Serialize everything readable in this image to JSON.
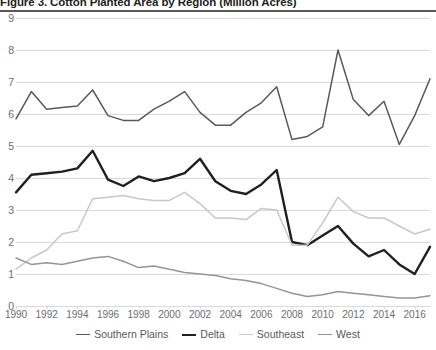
{
  "figure": {
    "title": "Figure 3. Cotton Planted Area by Region (Million Acres)"
  },
  "legend": {
    "position": "bottom-center",
    "items": [
      {
        "label": "Southern Plains",
        "color": "#58595b",
        "width": 1.6
      },
      {
        "label": "Delta",
        "color": "#231f20",
        "width": 2.6
      },
      {
        "label": "Southeast",
        "color": "#c7c8ca",
        "width": 1.6
      },
      {
        "label": "West",
        "color": "#939598",
        "width": 1.6
      }
    ]
  },
  "axis": {
    "y_ticks": [
      "0",
      "1",
      "2",
      "3",
      "4",
      "5",
      "6",
      "7",
      "8",
      "9"
    ],
    "x_ticks": [
      "1990",
      "1992",
      "1994",
      "1996",
      "1998",
      "2000",
      "2002",
      "2004",
      "2006",
      "2008",
      "2010",
      "2012",
      "2014",
      "2016"
    ]
  },
  "chart_data": {
    "type": "line",
    "title": "Figure 3. Cotton Planted Area by Region (Million Acres)",
    "xlabel": "",
    "ylabel": "Million Acres",
    "ylim": [
      0,
      9
    ],
    "xlim": [
      1990,
      2017
    ],
    "grid": true,
    "legend_position": "bottom-center",
    "x": [
      1990,
      1991,
      1992,
      1993,
      1994,
      1995,
      1996,
      1997,
      1998,
      1999,
      2000,
      2001,
      2002,
      2003,
      2004,
      2005,
      2006,
      2007,
      2008,
      2009,
      2010,
      2011,
      2012,
      2013,
      2014,
      2015,
      2016,
      2017
    ],
    "series": [
      {
        "name": "Southern Plains",
        "color": "#58595b",
        "values": [
          5.85,
          6.7,
          6.15,
          6.2,
          6.25,
          6.75,
          5.95,
          5.8,
          5.8,
          6.15,
          6.4,
          6.7,
          6.05,
          5.65,
          5.65,
          6.05,
          6.35,
          6.85,
          5.2,
          5.3,
          5.6,
          8.0,
          6.45,
          5.95,
          6.4,
          5.05,
          5.95,
          7.1
        ]
      },
      {
        "name": "Delta",
        "color": "#231f20",
        "values": [
          3.55,
          4.1,
          4.15,
          4.2,
          4.3,
          4.85,
          3.95,
          3.75,
          4.05,
          3.9,
          4.0,
          4.15,
          4.6,
          3.9,
          3.6,
          3.5,
          3.8,
          4.25,
          2.0,
          1.9,
          2.2,
          2.5,
          1.95,
          1.55,
          1.75,
          1.3,
          1.0,
          1.85
        ]
      },
      {
        "name": "Southeast",
        "color": "#c7c8ca",
        "values": [
          1.15,
          1.5,
          1.75,
          2.25,
          2.35,
          3.35,
          3.4,
          3.45,
          3.35,
          3.3,
          3.3,
          3.55,
          3.2,
          2.75,
          2.75,
          2.7,
          3.05,
          3.0,
          1.9,
          1.9,
          2.6,
          3.4,
          2.95,
          2.75,
          2.75,
          2.5,
          2.25,
          2.4
        ]
      },
      {
        "name": "West",
        "color": "#939598",
        "values": [
          1.5,
          1.3,
          1.35,
          1.3,
          1.4,
          1.5,
          1.55,
          1.4,
          1.2,
          1.25,
          1.15,
          1.05,
          1.0,
          0.95,
          0.85,
          0.8,
          0.7,
          0.55,
          0.4,
          0.3,
          0.35,
          0.45,
          0.4,
          0.35,
          0.3,
          0.25,
          0.25,
          0.32
        ]
      }
    ]
  }
}
